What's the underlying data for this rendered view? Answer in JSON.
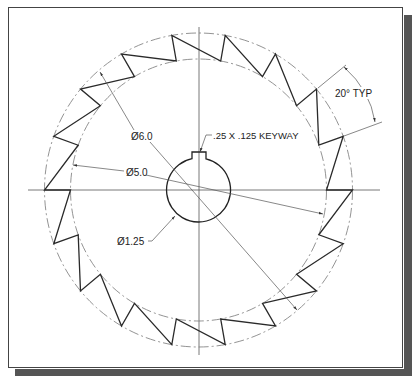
{
  "drawing": {
    "center": {
      "x": 198.5,
      "y": 190
    },
    "outer_radius_x": 154,
    "outer_radius_y": 157,
    "inner_radius_x": 128,
    "inner_radius_y": 131,
    "hub_radius": 32,
    "tooth_count": 18,
    "tooth_angle_deg": 20,
    "keyway": {
      "left": 192,
      "right": 206,
      "top": 152
    }
  },
  "labels": {
    "outer_diameter": "Ø6.0",
    "root_diameter": "Ø5.0",
    "bore_diameter": "Ø1.25",
    "keyway": ".25 X .125 KEYWAY",
    "tooth_angle": "20° TYP"
  },
  "colors": {
    "line": "#2a2a2a",
    "thin": "#6a6a6a",
    "shadow": "#555555"
  }
}
